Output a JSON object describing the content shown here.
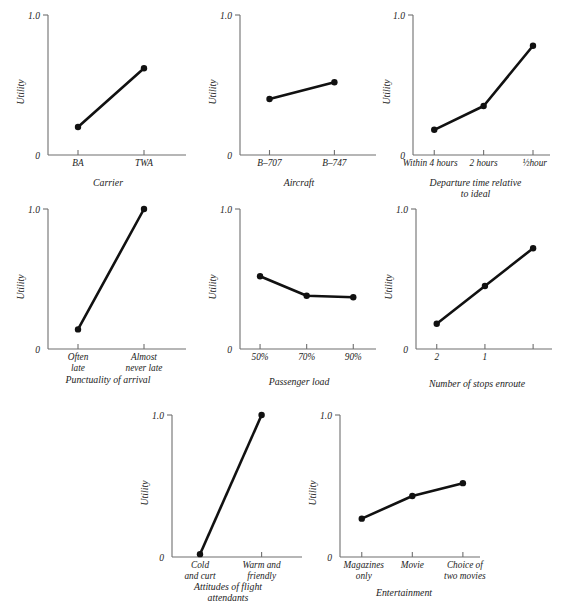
{
  "figure": {
    "caption": "",
    "width": 565,
    "height": 608,
    "axis_color": "#6f6f6f",
    "line_color": "#111111",
    "background": "#ffffff"
  },
  "chart_data": [
    {
      "type": "line",
      "id": "carrier",
      "title": "",
      "xlabel": "Carrier",
      "ylabel": "Utility",
      "categories": [
        "BA",
        "TWA"
      ],
      "values": [
        0.2,
        0.62
      ],
      "ylim": [
        0,
        1.0
      ],
      "ytick_labels": [
        "0",
        "1.0"
      ],
      "grid": false,
      "legend": "none"
    },
    {
      "type": "line",
      "id": "aircraft",
      "title": "",
      "xlabel": "Aircraft",
      "ylabel": "Utility",
      "categories": [
        "B–707",
        "B–747"
      ],
      "values": [
        0.4,
        0.52
      ],
      "ylim": [
        0,
        1.0
      ],
      "ytick_labels": [
        "0",
        "1.0"
      ],
      "grid": false,
      "legend": "none"
    },
    {
      "type": "line",
      "id": "departure-time",
      "title": "",
      "xlabel": "Departure time relative\nto ideal",
      "xlabel_line1": "Departure time relative",
      "xlabel_line2": "to ideal",
      "ylabel": "Utility",
      "categories": [
        "Within 4 hours",
        "2 hours",
        "½hour"
      ],
      "values": [
        0.18,
        0.35,
        0.78
      ],
      "ylim": [
        0,
        1.0
      ],
      "ytick_labels": [
        "0",
        "1.0"
      ],
      "grid": false,
      "legend": "none"
    },
    {
      "type": "line",
      "id": "punctuality",
      "title": "",
      "xlabel": "Punctuality of arrival",
      "ylabel": "Utility",
      "categories": [
        "Often late",
        "Almost never late"
      ],
      "category_lines": [
        [
          "Often",
          "late"
        ],
        [
          "Almost",
          "never late"
        ]
      ],
      "values": [
        0.14,
        1.0
      ],
      "ylim": [
        0,
        1.0
      ],
      "ytick_labels": [
        "0",
        "1.0"
      ],
      "grid": false,
      "legend": "none"
    },
    {
      "type": "line",
      "id": "passenger-load",
      "title": "",
      "xlabel": "Passenger load",
      "ylabel": "Utility",
      "categories": [
        "50%",
        "70%",
        "90%"
      ],
      "values": [
        0.52,
        0.38,
        0.37
      ],
      "ylim": [
        0,
        1.0
      ],
      "ytick_labels": [
        "0",
        "1.0"
      ],
      "grid": false,
      "legend": "none"
    },
    {
      "type": "line",
      "id": "stops-enroute",
      "title": "",
      "xlabel": "Number of stops enroute",
      "ylabel": "Utility",
      "categories": [
        "2",
        "1",
        ""
      ],
      "values": [
        0.18,
        0.45,
        0.72
      ],
      "ylim": [
        0,
        1.0
      ],
      "ytick_labels": [
        "0",
        "1.0"
      ],
      "grid": false,
      "legend": "none"
    },
    {
      "type": "line",
      "id": "attitudes",
      "title": "",
      "xlabel": "Attitudes of flight\nattendants",
      "xlabel_line1": "Attitudes of flight",
      "xlabel_line2": "attendants",
      "ylabel": "Utility",
      "categories": [
        "Cold and curt",
        "Warm and friendly"
      ],
      "category_lines": [
        [
          "Cold",
          "and curt"
        ],
        [
          "Warm and",
          "friendly"
        ]
      ],
      "values": [
        0.02,
        1.0
      ],
      "ylim": [
        0,
        1.0
      ],
      "ytick_labels": [
        "0",
        "1.0"
      ],
      "grid": false,
      "legend": "none"
    },
    {
      "type": "line",
      "id": "entertainment",
      "title": "",
      "xlabel": "Entertainment",
      "ylabel": "Utility",
      "categories": [
        "Magazines only",
        "Movie",
        "Choice of two movies"
      ],
      "category_lines": [
        [
          "Magazines",
          "only"
        ],
        [
          "Movie",
          ""
        ],
        [
          "Choice of",
          "two movies"
        ]
      ],
      "values": [
        0.27,
        0.43,
        0.52
      ],
      "ylim": [
        0,
        1.0
      ],
      "ytick_labels": [
        "0",
        "1.0"
      ],
      "grid": false,
      "legend": "none"
    }
  ]
}
